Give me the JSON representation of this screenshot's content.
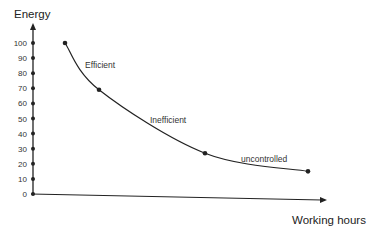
{
  "chart_data": {
    "type": "line",
    "title": "",
    "ylabel": "Energy",
    "xlabel": "Working hours",
    "ylim": [
      0,
      100
    ],
    "yticks": [
      0,
      10,
      20,
      30,
      40,
      50,
      60,
      70,
      80,
      90,
      100
    ],
    "ytick_labels": [
      "0",
      "10",
      "20",
      "30",
      "40",
      "50",
      "60",
      "70",
      "80",
      "90",
      "100"
    ],
    "xticks": [],
    "grid": false,
    "series": [
      {
        "name": "Energy curve",
        "x": [
          1,
          2,
          3,
          4
        ],
        "values": [
          100,
          69,
          27,
          15
        ]
      }
    ],
    "annotations": [
      {
        "text": "Efficient",
        "segment": "between points 1 and 2"
      },
      {
        "text": "Inefficient",
        "segment": "between points 2 and 3"
      },
      {
        "text": "uncontrolled",
        "segment": "between points 3 and 4"
      }
    ],
    "line_color": "#222222"
  }
}
